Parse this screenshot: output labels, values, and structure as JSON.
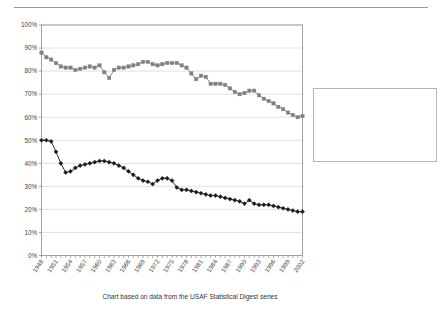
{
  "chart_data": {
    "type": "line",
    "title": "",
    "xlabel": "",
    "ylabel": "",
    "caption": "Chart based on data from the USAF Statistical Digest series",
    "ylim": [
      0,
      100
    ],
    "ytick_labels": [
      "0%",
      "10%",
      "20%",
      "30%",
      "40%",
      "50%",
      "60%",
      "70%",
      "80%",
      "90%",
      "100%"
    ],
    "ytick_values": [
      0,
      10,
      20,
      30,
      40,
      50,
      60,
      70,
      80,
      90,
      100
    ],
    "grid": true,
    "legend_position": "right",
    "xlim": [
      1948,
      2002
    ],
    "x": [
      1948,
      1949,
      1950,
      1951,
      1952,
      1953,
      1954,
      1955,
      1956,
      1957,
      1958,
      1959,
      1960,
      1961,
      1962,
      1963,
      1964,
      1965,
      1966,
      1967,
      1968,
      1969,
      1970,
      1971,
      1972,
      1973,
      1974,
      1975,
      1976,
      1977,
      1978,
      1979,
      1980,
      1981,
      1982,
      1983,
      1984,
      1985,
      1986,
      1987,
      1988,
      1989,
      1990,
      1991,
      1992,
      1993,
      1994,
      1995,
      1996,
      1997,
      1998,
      1999,
      2000,
      2001,
      2002
    ],
    "xtick_labels": [
      "1948",
      "1951",
      "1954",
      "1957",
      "1960",
      "1963",
      "1966",
      "1969",
      "1972",
      "1975",
      "1978",
      "1981",
      "1984",
      "1987",
      "1990",
      "1993",
      "1996",
      "1999",
      "2002"
    ],
    "xtick_values": [
      1948,
      1951,
      1954,
      1957,
      1960,
      1963,
      1966,
      1969,
      1972,
      1975,
      1978,
      1981,
      1984,
      1987,
      1990,
      1993,
      1996,
      1999,
      2002
    ],
    "series": [
      {
        "name": "% of Total GO are Pilots on Flying Status",
        "color": "#808080",
        "marker": "square",
        "values": [
          88.0,
          86.0,
          85.0,
          83.5,
          82.0,
          81.5,
          81.5,
          80.5,
          81.0,
          81.5,
          82.0,
          81.5,
          82.5,
          79.5,
          77.0,
          80.5,
          81.5,
          81.5,
          82.0,
          82.5,
          83.0,
          84.0,
          84.0,
          83.0,
          82.5,
          83.0,
          83.5,
          83.5,
          83.5,
          82.5,
          81.5,
          79.0,
          76.5,
          78.0,
          77.5,
          74.5,
          74.5,
          74.5,
          74.0,
          72.5,
          71.0,
          70.0,
          70.5,
          71.5,
          71.5,
          69.5,
          68.0,
          67.0,
          66.0,
          64.5,
          63.5,
          62.0,
          61.0,
          60.0,
          60.5
        ]
      },
      {
        "name": "% of Total Officers are Pilots on Flying Status",
        "color": "#1a1a1a",
        "marker": "diamond",
        "values": [
          50.0,
          50.0,
          49.5,
          45.0,
          40.0,
          36.0,
          36.5,
          38.0,
          39.0,
          39.5,
          40.0,
          40.5,
          41.0,
          41.0,
          40.5,
          40.0,
          39.0,
          38.0,
          36.5,
          35.0,
          33.5,
          32.5,
          32.0,
          31.0,
          32.5,
          33.5,
          33.5,
          32.5,
          29.5,
          28.5,
          28.5,
          28.0,
          27.5,
          27.0,
          26.5,
          26.0,
          26.0,
          25.5,
          25.0,
          24.5,
          24.0,
          23.5,
          22.5,
          24.0,
          22.5,
          22.0,
          22.0,
          22.0,
          21.5,
          21.0,
          20.5,
          20.0,
          19.5,
          19.0,
          19.0
        ]
      }
    ]
  },
  "legend": {
    "items": [
      {
        "label_line1": "% of Total GO are Pilots on",
        "label_line2": "Flying Status"
      },
      {
        "label_line1": "% of Total Officers are Pilots",
        "label_line2": "on Flying Status"
      }
    ]
  }
}
